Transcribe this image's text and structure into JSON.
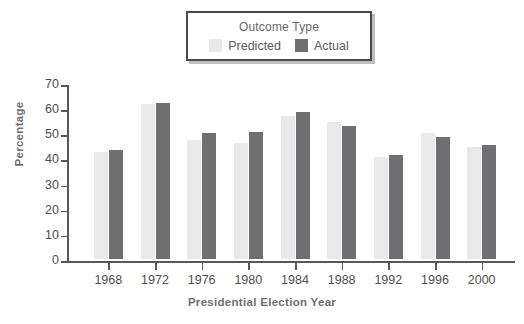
{
  "chart_data": {
    "type": "bar",
    "title": "",
    "xlabel": "Presidential Election Year",
    "ylabel": "Percentage",
    "categories": [
      "1968",
      "1972",
      "1976",
      "1980",
      "1984",
      "1988",
      "1992",
      "1996",
      "2000"
    ],
    "series": [
      {
        "name": "Predicted",
        "color": "#e9e9e9",
        "values": [
          42.5,
          61.5,
          47.5,
          46.0,
          57.0,
          54.5,
          40.5,
          50.0,
          44.5
        ]
      },
      {
        "name": "Actual",
        "color": "#6f6f71",
        "values": [
          43.5,
          62.0,
          50.0,
          50.5,
          58.5,
          53.0,
          41.5,
          48.5,
          45.5
        ]
      }
    ],
    "ylim": [
      0,
      70
    ],
    "yticks": [
      0,
      10,
      20,
      30,
      40,
      50,
      60,
      70
    ],
    "grid": false,
    "legend": {
      "title": "Outcome Type",
      "position": "top-center",
      "entries": [
        {
          "label": "Predicted",
          "color": "#e9e9e9"
        },
        {
          "label": "Actual",
          "color": "#6f6f71"
        }
      ]
    }
  },
  "legend": {
    "title": "Outcome Type",
    "entries": [
      {
        "label": "Predicted",
        "swatch_name": "legend-swatch-predicted"
      },
      {
        "label": "Actual",
        "swatch_name": "legend-swatch-actual"
      }
    ]
  },
  "axes": {
    "ylabel": "Percentage",
    "xlabel": "Presidential Election Year"
  },
  "colors": {
    "predicted": "#e9e9e9",
    "actual": "#6f6f71",
    "axis": "#58585a",
    "text": "#4e4e4e",
    "label": "#6e6e6e",
    "legend_border": "#4a4a4a",
    "background": "#ffffff"
  }
}
